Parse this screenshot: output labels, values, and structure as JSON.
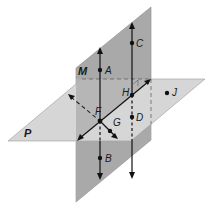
{
  "diagram": {
    "planes": [
      {
        "name": "M",
        "label": "M",
        "orientation": "vertical",
        "fill": "#a8a8a8"
      },
      {
        "name": "P",
        "label": "P",
        "orientation": "horizontal",
        "fill": "#d2d2d2"
      }
    ],
    "points": [
      {
        "label": "A"
      },
      {
        "label": "B"
      },
      {
        "label": "C"
      },
      {
        "label": "D"
      },
      {
        "label": "F"
      },
      {
        "label": "G"
      },
      {
        "label": "H"
      },
      {
        "label": "J"
      }
    ],
    "lines": [
      {
        "through": "A-F-B",
        "style": "solid, dashed behind P"
      },
      {
        "through": "C-H-D",
        "style": "solid, dashed behind P"
      },
      {
        "through": "F-H",
        "style": "solid (intersection of M and P)"
      },
      {
        "through": "F-G",
        "style": "dashed behind M, solid in front"
      }
    ],
    "colors": {
      "plane_M": "#a8a8a8",
      "plane_P": "#d2d2d2",
      "line": "#111111",
      "dashed": "#444444"
    }
  }
}
